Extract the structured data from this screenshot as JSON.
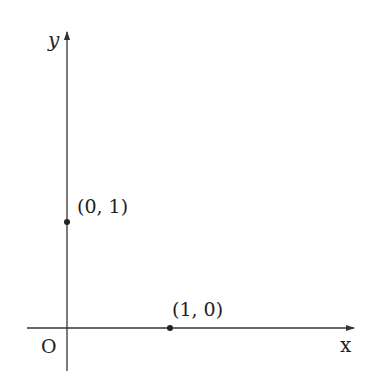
{
  "diagram": {
    "type": "coordinate-axes",
    "axes": {
      "x_label": "x",
      "y_label": "y",
      "origin_label": "O"
    },
    "points": [
      {
        "label": "(0, 1)",
        "x": 0,
        "y": 1
      },
      {
        "label": "(1, 0)",
        "x": 1,
        "y": 0
      }
    ],
    "colors": {
      "line": "#333333",
      "text": "#222222",
      "background": "#ffffff"
    }
  }
}
